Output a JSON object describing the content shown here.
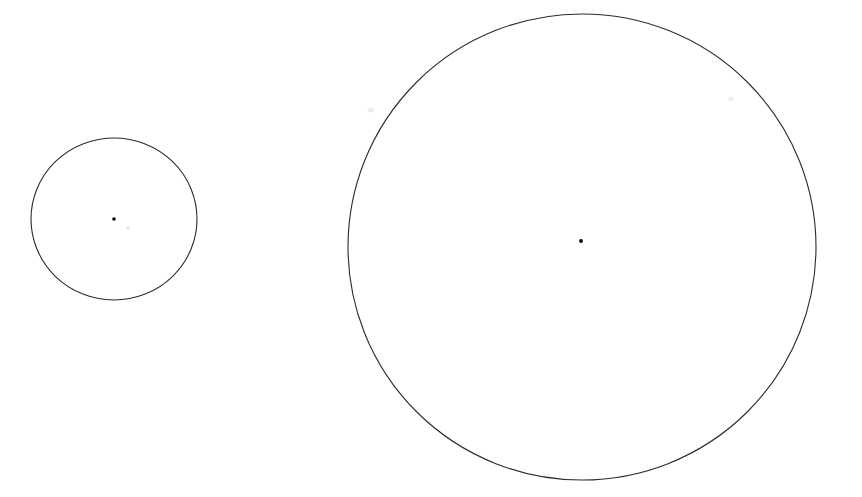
{
  "canvas": {
    "width": 862,
    "height": 497,
    "background_color": "#ffffff",
    "description": "Two hand-drawn-looking circle outlines of different sizes on a plain white background, each marked with a small black dot at its center."
  },
  "figure": {
    "type": "geometry-diagram",
    "shape_count": 2,
    "stroke_color": "#2b2b2b",
    "stroke_width": 1.1,
    "dot_color": "#000000",
    "shapes": [
      {
        "name": "small-circle",
        "kind": "circle",
        "center_x": 114,
        "center_y": 219,
        "radius_x": 83,
        "radius_y": 81,
        "left": 31,
        "right": 197,
        "top": 138,
        "bottom": 300,
        "center_dot": {
          "name": "small-circle-center-dot",
          "x": 114,
          "y": 219,
          "radius": 1.8,
          "color": "#000000"
        }
      },
      {
        "name": "large-circle",
        "kind": "circle",
        "center_x": 582,
        "center_y": 247,
        "radius_x": 234,
        "radius_y": 233,
        "left": 348,
        "right": 816,
        "top": 14,
        "bottom": 480,
        "center_dot": {
          "name": "large-circle-center-dot",
          "x": 581,
          "y": 241,
          "radius": 1.9,
          "color": "#000000"
        }
      }
    ],
    "artifacts": [
      {
        "name": "faint-pink-speck",
        "x": 128,
        "y": 228,
        "radius": 1.6,
        "color": "#f0dede"
      },
      {
        "name": "faint-gray-smudge-left",
        "x": 371,
        "y": 110,
        "radius": 2.4,
        "color": "#ededee"
      },
      {
        "name": "faint-gray-smudge-right",
        "x": 731,
        "y": 99,
        "radius": 2.2,
        "color": "#eeeeef"
      }
    ]
  }
}
